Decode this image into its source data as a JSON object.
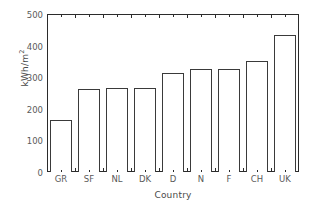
{
  "chart_data": {
    "type": "bar",
    "title": "",
    "subtitle": "",
    "xlabel": "Country",
    "ylabel": "kWh/m²",
    "ylabel_base": "kWh/m",
    "ylabel_sup": "2",
    "categories": [
      "GR",
      "SF",
      "NL",
      "DK",
      "D",
      "N",
      "F",
      "CH",
      "UK"
    ],
    "values": [
      165,
      262,
      265,
      267,
      312,
      325,
      325,
      350,
      433
    ],
    "ylim": [
      0,
      500
    ],
    "ytick_labels": [
      "0",
      "100",
      "200",
      "300",
      "400",
      "500"
    ],
    "ytick_values": [
      0,
      100,
      200,
      300,
      400,
      500
    ],
    "yminor_values": [
      50,
      150,
      250,
      350,
      450
    ],
    "grid": false,
    "legend": null,
    "bar_facecolor": "#ffffff",
    "bar_edgecolor": "#3a3a3a",
    "axis_color": "#2b2b2b",
    "text_color": "#555555",
    "background": "#ffffff"
  }
}
